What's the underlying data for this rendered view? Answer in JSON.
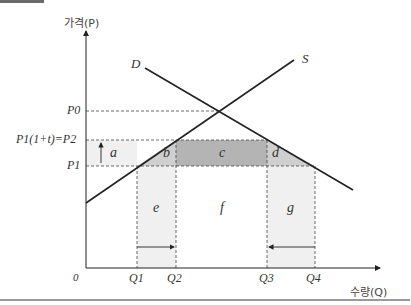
{
  "axes": {
    "y_label": "가격(P)",
    "x_label": "수량(Q)",
    "origin": "0"
  },
  "curves": {
    "demand": "D",
    "supply": "S"
  },
  "price_labels": {
    "p0": "P0",
    "p2": "P1(1+t)=P2",
    "p1": "P1"
  },
  "quantity_labels": [
    "Q1",
    "Q2",
    "Q3",
    "Q4"
  ],
  "areas": {
    "a": "a",
    "b": "b",
    "c": "c",
    "d": "d",
    "e": "e",
    "f": "f",
    "g": "g"
  },
  "colors": {
    "area_light": "#efefef",
    "area_mid": "#cfcfcf",
    "area_dark": "#b4b4b4",
    "line": "#222222"
  }
}
